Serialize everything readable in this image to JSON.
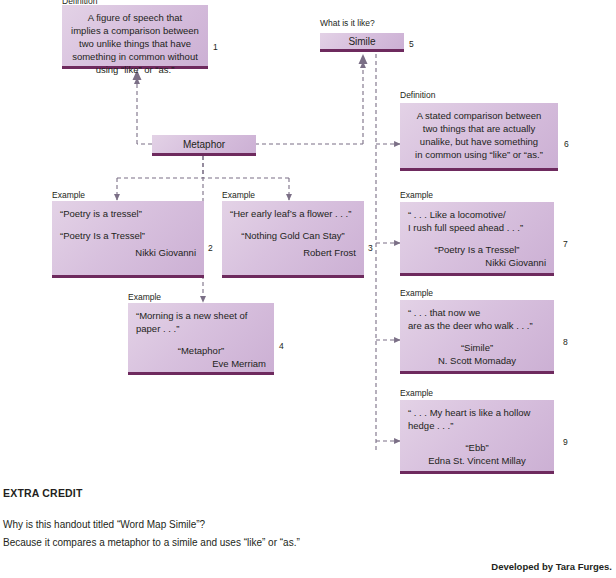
{
  "page": {
    "width": 616,
    "height": 578,
    "accent_fill_light": "#e3d2e6",
    "accent_fill_dark": "#ccb0d4",
    "accent_rule": "#6e2a5e",
    "wire_color": "#7b6f86",
    "text_color": "#231f20"
  },
  "nodes": {
    "definition_metaphor": {
      "caption": "Definition",
      "number": "1",
      "lines": [
        "A figure of speech that",
        "implies a comparison between",
        "two unlike things that have",
        "something in common without",
        "using “like” or “as.”"
      ]
    },
    "metaphor": {
      "title": "Metaphor"
    },
    "simile": {
      "caption": "What is it like?",
      "title": "Simile",
      "number": "5"
    },
    "example_tressel": {
      "caption": "Example",
      "number": "2",
      "quote": "“Poetry is a tressel”",
      "source_title": "“Poetry Is a Tressel”",
      "author": "Nikki Giovanni"
    },
    "example_gold": {
      "caption": "Example",
      "number": "3",
      "quote": "“Her early leaf’s a flower . . .”",
      "source_title": "“Nothing Gold Can Stay”",
      "author": "Robert Frost"
    },
    "example_morning": {
      "caption": "Example",
      "number": "4",
      "quote_line1": "“Morning is a new sheet of",
      "quote_line2": "paper . . .”",
      "source_title": "“Metaphor”",
      "author": "Eve Merriam"
    },
    "definition_simile": {
      "caption": "Definition",
      "number": "6",
      "lines": [
        "A stated comparison between",
        "two things that are actually",
        "unalike, but have something",
        "in common using “like” or “as.”"
      ]
    },
    "example_locomotive": {
      "caption": "Example",
      "number": "7",
      "quote_line1": "“ . . . Like a locomotive/",
      "quote_line2": "I rush full speed ahead . . .”",
      "source_title": "“Poetry Is a Tressel”",
      "author": "Nikki Giovanni"
    },
    "example_deer": {
      "caption": "Example",
      "number": "8",
      "quote_line1": "“ . . . that now we",
      "quote_line2": "are as the deer who walk . . .”",
      "source_title": "“Simile”",
      "author": "N. Scott Momaday"
    },
    "example_ebb": {
      "caption": "Example",
      "number": "9",
      "quote_line1": "“ . . . My heart is like a hollow",
      "quote_line2": "hedge . . .”",
      "source_title": "“Ebb”",
      "author": "Edna St. Vincent Millay"
    }
  },
  "extra_credit": {
    "heading": "EXTRA CREDIT",
    "question": "Why is this handout titled “Word Map Simile”?",
    "answer": "Because it compares a metaphor to a simile and uses “like” or “as.”"
  },
  "credit": "Developed by Tara Furges."
}
